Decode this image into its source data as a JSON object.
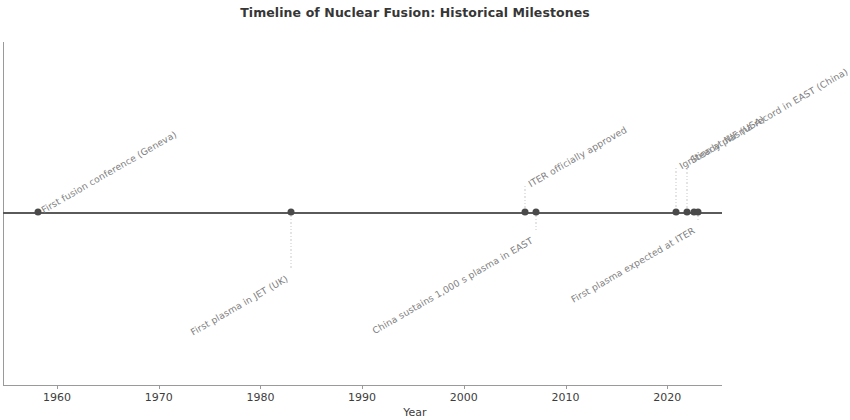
{
  "chart_data": {
    "type": "timeline",
    "title": "Timeline of Nuclear Fusion: Historical Milestones",
    "xlabel": "Year",
    "ylabel": "",
    "xlim": [
      1955.5,
      2026.5
    ],
    "grid": false,
    "legend": null,
    "axis_ticks": [
      "1960",
      "1970",
      "1980",
      "1990",
      "2000",
      "2010",
      "2020"
    ],
    "tick_values": [
      1960,
      1970,
      1980,
      1990,
      2000,
      2010,
      2020
    ],
    "line_color": "#5a5a5a",
    "marker_color": "#4a4a4a",
    "label_color": "#7e7e7e",
    "events": [
      {
        "year": 1958,
        "label": "First fusion conference (Geneva)",
        "side": "above",
        "x_px": 38,
        "stem_px": 0
      },
      {
        "year": 1983,
        "label": "First plasma in JET (UK)",
        "side": "below",
        "x_px": 291,
        "stem_px": 58
      },
      {
        "year": 2006,
        "label": "ITER officially approved",
        "side": "above",
        "x_px": 525,
        "stem_px": 26
      },
      {
        "year": 2007,
        "label": "China sustains 1,000 s plasma in EAST",
        "side": "below",
        "x_px": 536,
        "stem_px": 20
      },
      {
        "year": 2021,
        "label": "Ignition at NIF (USA)",
        "side": "above",
        "x_px": 676,
        "stem_px": 44
      },
      {
        "year": 2022,
        "label": "Steady plasma record in EAST (China)",
        "side": "above",
        "x_px": 687,
        "stem_px": 50
      },
      {
        "year": 2023,
        "label": "",
        "side": "none",
        "x_px": 694,
        "stem_px": 0
      },
      {
        "year": 2025,
        "label": "First plasma expected at ITER",
        "side": "below",
        "x_px": 698,
        "stem_px": 10
      }
    ]
  }
}
